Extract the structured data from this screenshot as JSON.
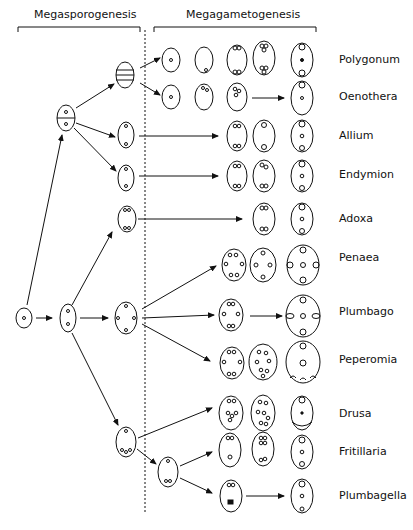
{
  "headers": {
    "left": "Megasporogenesis",
    "right": "Megagametogenesis"
  },
  "labels": [
    {
      "text": "Polygonum",
      "y": 60
    },
    {
      "text": "Oenothera",
      "y": 97
    },
    {
      "text": "Allium",
      "y": 136
    },
    {
      "text": "Endymion",
      "y": 175
    },
    {
      "text": "Adoxa",
      "y": 219
    },
    {
      "text": "Penaea",
      "y": 258
    },
    {
      "text": "Plumbago",
      "y": 312
    },
    {
      "text": "Peperomia",
      "y": 360
    },
    {
      "text": "Drusa",
      "y": 414
    },
    {
      "text": "Fritillaria",
      "y": 452
    },
    {
      "text": "Plumbagella",
      "y": 496
    }
  ],
  "colors": {
    "ink": "#111111",
    "background": "#ffffff"
  }
}
